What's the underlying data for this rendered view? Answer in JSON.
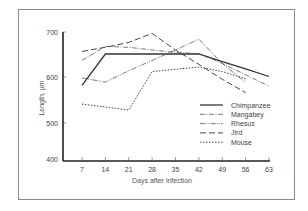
{
  "chart_data": {
    "type": "line",
    "title": "",
    "xlabel": "Days after infection",
    "ylabel": "Length, µm",
    "x": [
      7,
      14,
      21,
      28,
      35,
      42,
      49,
      56,
      63
    ],
    "x_tick_labels": [
      "7",
      "14",
      "21",
      "28",
      "35",
      "42",
      "49",
      "56",
      "63"
    ],
    "y_tick_labels": [
      "400",
      "500",
      "600",
      "700"
    ],
    "ylim": [
      400,
      700
    ],
    "grid": false,
    "legend_position": "lower right inside",
    "series": [
      {
        "name": "Chimpanzee",
        "style": "solid",
        "x": [
          7,
          14,
          21,
          28,
          35,
          42,
          49,
          56,
          63
        ],
        "values": [
          582,
          651,
          651,
          651,
          651,
          651,
          634,
          618,
          601
        ]
      },
      {
        "name": "Mangabey",
        "style": "dash-dot",
        "x": [
          7,
          14,
          21,
          28,
          35,
          42,
          49,
          56,
          63
        ],
        "values": [
          637,
          668,
          666,
          660,
          655,
          652,
          630,
          605,
          580
        ]
      },
      {
        "name": "Rhesus",
        "style": "dash-dot-dot",
        "x": [
          7,
          14,
          21,
          28,
          35,
          42,
          49,
          56
        ],
        "values": [
          598,
          589,
          614,
          637,
          660,
          684,
          630,
          588
        ]
      },
      {
        "name": "Jird",
        "style": "long-dash",
        "x": [
          7,
          14,
          21,
          28,
          35,
          42,
          49,
          56
        ],
        "values": [
          657,
          666,
          677,
          697,
          660,
          628,
          595,
          566
        ]
      },
      {
        "name": "Mouse",
        "style": "dotted",
        "x": [
          7,
          14,
          21,
          28,
          35,
          42,
          49,
          56
        ],
        "values": [
          541,
          535,
          528,
          612,
          617,
          622,
          612,
          596
        ]
      }
    ]
  },
  "legend": {
    "items": [
      "Chimpanzee",
      "Mangabey",
      "Rhesus",
      "Jird",
      "Mouse"
    ]
  },
  "axes": {
    "xlabel": "Days after infection",
    "ylabel": "Length, µm",
    "y_ticks": [
      "700",
      "600",
      "500",
      "400"
    ],
    "x_ticks": [
      "7",
      "14",
      "21",
      "28",
      "35",
      "42",
      "49",
      "56",
      "63"
    ]
  }
}
